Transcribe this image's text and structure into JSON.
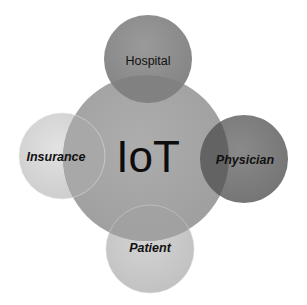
{
  "diagram": {
    "center": {
      "label": "IoT",
      "cx": 146,
      "cy": 158,
      "r": 83,
      "color": "#9c9c9c"
    },
    "satellites": [
      {
        "id": "hospital",
        "label": "Hospital",
        "cx": 148,
        "cy": 59,
        "r": 44,
        "color": "#8e8e8e",
        "italic": false
      },
      {
        "id": "insurance",
        "label": "Insurance",
        "cx": 62,
        "cy": 156,
        "r": 43,
        "color": "#d6d6d6",
        "italic": true
      },
      {
        "id": "physician",
        "label": "Physician",
        "cx": 244,
        "cy": 159,
        "r": 44,
        "color": "#7f7f7f",
        "italic": true
      },
      {
        "id": "patient",
        "label": "Patient",
        "cx": 150,
        "cy": 249,
        "r": 44,
        "color": "#c9c9c9",
        "italic": true
      }
    ]
  }
}
